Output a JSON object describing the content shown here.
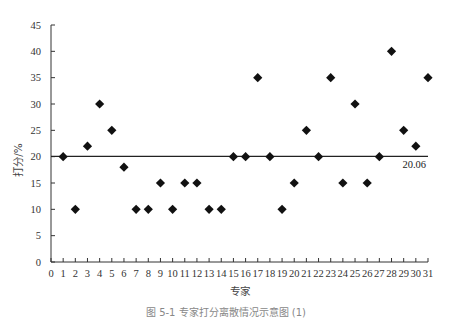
{
  "chart_data": {
    "type": "scatter",
    "title": "",
    "xlabel": "专家",
    "ylabel": "打分/%",
    "xlim": [
      0,
      31
    ],
    "ylim": [
      0,
      45
    ],
    "x_ticks": [
      0,
      1,
      2,
      3,
      4,
      5,
      6,
      7,
      8,
      9,
      10,
      11,
      12,
      13,
      14,
      15,
      16,
      17,
      18,
      19,
      20,
      21,
      22,
      23,
      24,
      25,
      26,
      27,
      28,
      29,
      30,
      31
    ],
    "y_ticks": [
      0,
      5,
      10,
      15,
      20,
      25,
      30,
      35,
      40,
      45
    ],
    "grid": false,
    "legend": null,
    "marker": "diamond",
    "series": [
      {
        "name": "专家打分",
        "x": [
          1,
          2,
          3,
          4,
          5,
          6,
          7,
          8,
          9,
          10,
          11,
          12,
          13,
          14,
          15,
          16,
          17,
          18,
          19,
          20,
          21,
          22,
          23,
          24,
          25,
          26,
          27,
          28,
          29,
          30,
          31
        ],
        "values": [
          20,
          10,
          22,
          30,
          25,
          18,
          10,
          10,
          15,
          10,
          15,
          15,
          10,
          10,
          20,
          20,
          35,
          20,
          10,
          15,
          25,
          20,
          35,
          15,
          30,
          15,
          20,
          40,
          25,
          22,
          35
        ]
      }
    ],
    "reference_line": {
      "y": 20.06,
      "label": "20.06",
      "x_from": 0,
      "x_to": 31
    }
  },
  "caption": "图 5-1  专家打分离散情况示意图 (1)",
  "colors": {
    "axis": "#333333",
    "marker": "#111111",
    "ref_line": "#222222"
  }
}
